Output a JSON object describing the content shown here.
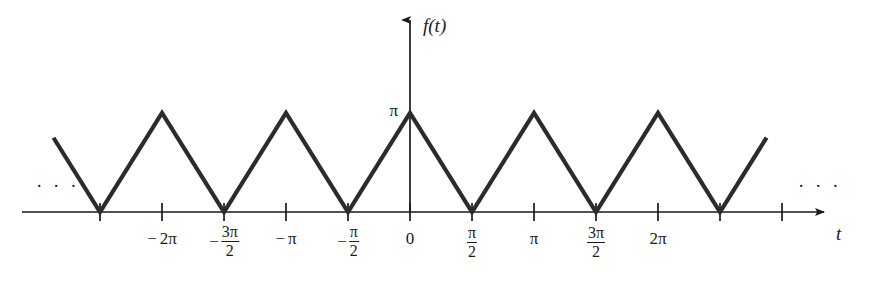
{
  "figure": {
    "kind": "triangular-wave-plot",
    "background_color": "#ffffff",
    "ink_color": "#1a1a1a",
    "curve_color": "#2b2b2b"
  },
  "axes": {
    "y_axis_label": "f(t)",
    "x_axis_label": "t",
    "y_value_label": "π",
    "origin_label": "0",
    "left_continuation": "· · ·",
    "right_continuation": "· · ·"
  },
  "x_ticks": [
    {
      "id": "tick-neg-5pi-2",
      "value": -7.854,
      "label_kind": "none",
      "sign": "",
      "num": "",
      "den": "",
      "text": ""
    },
    {
      "id": "tick-neg-2pi",
      "value": -6.283,
      "label_kind": "plain",
      "sign": "−",
      "num": "",
      "den": "",
      "text": "2π"
    },
    {
      "id": "tick-neg-3pi-2",
      "value": -4.712,
      "label_kind": "frac",
      "sign": "−",
      "num": "3π",
      "den": "2",
      "text": ""
    },
    {
      "id": "tick-neg-pi",
      "value": -3.142,
      "label_kind": "plain",
      "sign": "−",
      "num": "",
      "den": "",
      "text": "π"
    },
    {
      "id": "tick-neg-pi-2",
      "value": -1.571,
      "label_kind": "frac",
      "sign": "−",
      "num": "π",
      "den": "2",
      "text": ""
    },
    {
      "id": "tick-zero",
      "value": 0,
      "label_kind": "plain",
      "sign": "",
      "num": "",
      "den": "",
      "text": "0"
    },
    {
      "id": "tick-pi-2",
      "value": 1.571,
      "label_kind": "frac",
      "sign": "",
      "num": "π",
      "den": "2",
      "text": ""
    },
    {
      "id": "tick-pi",
      "value": 3.142,
      "label_kind": "plain",
      "sign": "",
      "num": "",
      "den": "",
      "text": "π"
    },
    {
      "id": "tick-3pi-2",
      "value": 4.712,
      "label_kind": "frac",
      "sign": "",
      "num": "3π",
      "den": "2",
      "text": ""
    },
    {
      "id": "tick-2pi",
      "value": 6.283,
      "label_kind": "plain",
      "sign": "",
      "num": "",
      "den": "",
      "text": "2π"
    },
    {
      "id": "tick-5pi-2",
      "value": 7.854,
      "label_kind": "none",
      "sign": "",
      "num": "",
      "den": "",
      "text": ""
    },
    {
      "id": "tick-3pi",
      "value": 9.425,
      "label_kind": "none",
      "sign": "",
      "num": "",
      "den": "",
      "text": ""
    }
  ],
  "chart_data": {
    "type": "line",
    "title": "",
    "subtitle": "",
    "xlabel": "t",
    "ylabel": "f(t)",
    "grid": false,
    "legend": null,
    "xlim": [
      -9.4,
      10.0
    ],
    "ylim": [
      0,
      3.6
    ],
    "series": [
      {
        "name": "f(t)",
        "description": "Triangular wave, period π, peak value π at integer multiples of π, zeros at odd multiples of π/2",
        "x": [
          -9.032,
          -7.854,
          -6.283,
          -4.712,
          -3.142,
          -1.571,
          0,
          1.571,
          3.142,
          4.712,
          6.283,
          7.854,
          9.034
        ],
        "y": [
          2.356,
          0,
          3.142,
          0,
          3.142,
          0,
          3.142,
          0,
          3.142,
          0,
          3.142,
          0,
          2.362
        ]
      }
    ],
    "annotations": [
      {
        "text": "π",
        "x": 0,
        "y": 3.142,
        "role": "y-value-marker"
      },
      {
        "text": "· · ·",
        "x": -8.5,
        "y": 0.75,
        "role": "continuation-left"
      },
      {
        "text": "· · ·",
        "x": 9.4,
        "y": 0.75,
        "role": "continuation-right"
      }
    ]
  },
  "geometry": {
    "baseline_y": 212,
    "peak_y": 113,
    "origin_x": 410,
    "px_per_half_pi": 62,
    "x_axis_start": 22,
    "x_axis_end": 830,
    "y_axis_top": 12,
    "tick_half_len": 9
  }
}
